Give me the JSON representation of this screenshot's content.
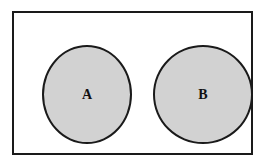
{
  "diagram": {
    "type": "venn-diagram",
    "universe": {
      "name": "universal-set-rectangle",
      "fill_color": "#ffffff",
      "border_color": "#1a1a1a",
      "border_width_px": 2
    },
    "sets": [
      {
        "id": "a",
        "label": "A",
        "shape": "circle",
        "fill_color": "#d2d2d2",
        "border_color": "#1a1a1a",
        "border_width_px": 2
      },
      {
        "id": "b",
        "label": "B",
        "shape": "circle",
        "fill_color": "#d2d2d2",
        "border_color": "#1a1a1a",
        "border_width_px": 2
      }
    ],
    "intersection": {
      "exists": false,
      "label": ""
    }
  }
}
